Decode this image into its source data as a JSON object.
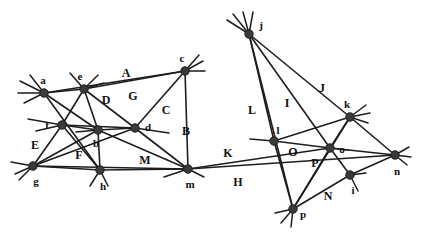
{
  "figure": {
    "width": 421,
    "height": 236,
    "background_color": "#ffffff",
    "stroke_color": "#1d1d1d",
    "vertex_color": "#3a3a3a"
  },
  "chart_data": {
    "type": "diagram",
    "xlabel": "",
    "ylabel": "",
    "xlim": [
      0,
      421
    ],
    "ylim": [
      0,
      236
    ],
    "grid": false,
    "legend": "none",
    "points": [
      {
        "id": "a",
        "label": "a",
        "x": 44,
        "y": 93,
        "label_x": 43,
        "label_y": 80
      },
      {
        "id": "e",
        "label": "e",
        "x": 84,
        "y": 89,
        "label_x": 80,
        "label_y": 76
      },
      {
        "id": "c",
        "label": "c",
        "x": 185,
        "y": 71,
        "label_x": 182,
        "label_y": 58
      },
      {
        "id": "f",
        "label": "f",
        "x": 62,
        "y": 125,
        "label_x": 47,
        "label_y": 125
      },
      {
        "id": "b",
        "label": "b",
        "x": 98,
        "y": 130,
        "label_x": 96,
        "label_y": 143
      },
      {
        "id": "d",
        "label": "d",
        "x": 135,
        "y": 128,
        "label_x": 148,
        "label_y": 127
      },
      {
        "id": "g",
        "label": "g",
        "x": 33,
        "y": 166,
        "label_x": 36,
        "label_y": 181
      },
      {
        "id": "h",
        "label": "h",
        "x": 100,
        "y": 170,
        "label_x": 103,
        "label_y": 186
      },
      {
        "id": "m",
        "label": "m",
        "x": 188,
        "y": 169,
        "label_x": 190,
        "label_y": 184
      },
      {
        "id": "j",
        "label": "j",
        "x": 249,
        "y": 34,
        "label_x": 261,
        "label_y": 25
      },
      {
        "id": "k",
        "label": "k",
        "x": 350,
        "y": 117,
        "label_x": 347,
        "label_y": 104
      },
      {
        "id": "l",
        "label": "l",
        "x": 274,
        "y": 141,
        "label_x": 278,
        "label_y": 130
      },
      {
        "id": "o",
        "label": "o",
        "x": 330,
        "y": 148,
        "label_x": 342,
        "label_y": 149
      },
      {
        "id": "n",
        "label": "n",
        "x": 395,
        "y": 155,
        "label_x": 397,
        "label_y": 171
      },
      {
        "id": "i",
        "label": "i",
        "x": 350,
        "y": 175,
        "label_x": 353,
        "label_y": 190
      },
      {
        "id": "p",
        "label": "p",
        "x": 293,
        "y": 209,
        "label_x": 303,
        "label_y": 214
      }
    ],
    "line_labels": [
      {
        "id": "A",
        "label": "A",
        "x": 126,
        "y": 73
      },
      {
        "id": "B",
        "label": "B",
        "x": 186,
        "y": 131
      },
      {
        "id": "C",
        "label": "C",
        "x": 166,
        "y": 110
      },
      {
        "id": "D",
        "label": "D",
        "x": 106,
        "y": 100
      },
      {
        "id": "E",
        "label": "E",
        "x": 35,
        "y": 145
      },
      {
        "id": "F",
        "label": "F",
        "x": 79,
        "y": 155
      },
      {
        "id": "G",
        "label": "G",
        "x": 133,
        "y": 96
      },
      {
        "id": "H",
        "label": "H",
        "x": 238,
        "y": 182
      },
      {
        "id": "I",
        "label": "I",
        "x": 287,
        "y": 103
      },
      {
        "id": "J",
        "label": "J",
        "x": 322,
        "y": 88
      },
      {
        "id": "K",
        "label": "K",
        "x": 228,
        "y": 153
      },
      {
        "id": "L",
        "label": "L",
        "x": 252,
        "y": 110
      },
      {
        "id": "M",
        "label": "M",
        "x": 145,
        "y": 160
      },
      {
        "id": "N",
        "label": "N",
        "x": 328,
        "y": 196
      },
      {
        "id": "O",
        "label": "O",
        "x": 293,
        "y": 152
      },
      {
        "id": "P",
        "label": "P",
        "x": 315,
        "y": 163
      }
    ],
    "edges": [
      {
        "from": "a",
        "to": "e"
      },
      {
        "from": "e",
        "to": "c"
      },
      {
        "from": "a",
        "to": "c"
      },
      {
        "from": "a",
        "to": "b"
      },
      {
        "from": "a",
        "to": "h"
      },
      {
        "from": "e",
        "to": "f"
      },
      {
        "from": "e",
        "to": "b"
      },
      {
        "from": "e",
        "to": "d"
      },
      {
        "from": "f",
        "to": "b"
      },
      {
        "from": "f",
        "to": "d"
      },
      {
        "from": "f",
        "to": "g"
      },
      {
        "from": "f",
        "to": "h"
      },
      {
        "from": "b",
        "to": "d"
      },
      {
        "from": "b",
        "to": "g"
      },
      {
        "from": "b",
        "to": "h"
      },
      {
        "from": "b",
        "to": "m"
      },
      {
        "from": "d",
        "to": "c"
      },
      {
        "from": "d",
        "to": "g"
      },
      {
        "from": "d",
        "to": "m"
      },
      {
        "from": "c",
        "to": "m"
      },
      {
        "from": "g",
        "to": "h"
      },
      {
        "from": "h",
        "to": "m"
      },
      {
        "from": "g",
        "to": "m"
      },
      {
        "from": "m",
        "to": "o"
      },
      {
        "from": "m",
        "to": "n"
      },
      {
        "from": "j",
        "to": "l"
      },
      {
        "from": "j",
        "to": "p"
      },
      {
        "from": "j",
        "to": "k"
      },
      {
        "from": "j",
        "to": "o"
      },
      {
        "from": "l",
        "to": "o"
      },
      {
        "from": "l",
        "to": "k"
      },
      {
        "from": "l",
        "to": "p"
      },
      {
        "from": "k",
        "to": "o"
      },
      {
        "from": "k",
        "to": "n"
      },
      {
        "from": "k",
        "to": "p"
      },
      {
        "from": "o",
        "to": "n"
      },
      {
        "from": "o",
        "to": "i"
      },
      {
        "from": "o",
        "to": "p"
      },
      {
        "from": "i",
        "to": "n"
      },
      {
        "from": "i",
        "to": "p"
      }
    ],
    "stubs": [
      {
        "at": "a",
        "dx": -24,
        "dy": -12
      },
      {
        "at": "a",
        "dx": -26,
        "dy": 0
      },
      {
        "at": "a",
        "dx": -20,
        "dy": 10
      },
      {
        "at": "a",
        "dx": -14,
        "dy": -18
      },
      {
        "at": "e",
        "dx": -14,
        "dy": -16
      },
      {
        "at": "e",
        "dx": 14,
        "dy": -14
      },
      {
        "at": "e",
        "dx": 20,
        "dy": -6
      },
      {
        "at": "c",
        "dx": 18,
        "dy": -10
      },
      {
        "at": "c",
        "dx": 20,
        "dy": 0
      },
      {
        "at": "c",
        "dx": 14,
        "dy": -16
      },
      {
        "at": "f",
        "dx": -34,
        "dy": -6
      },
      {
        "at": "f",
        "dx": -26,
        "dy": 6
      },
      {
        "at": "g",
        "dx": -22,
        "dy": -4
      },
      {
        "at": "g",
        "dx": -14,
        "dy": 14
      },
      {
        "at": "g",
        "dx": -18,
        "dy": 8
      },
      {
        "at": "h",
        "dx": -10,
        "dy": 16
      },
      {
        "at": "h",
        "dx": 8,
        "dy": 16
      },
      {
        "at": "d",
        "dx": 34,
        "dy": 5
      },
      {
        "at": "b",
        "dx": -22,
        "dy": 2
      },
      {
        "at": "m",
        "dx": -24,
        "dy": 8
      },
      {
        "at": "m",
        "dx": 16,
        "dy": 8
      },
      {
        "at": "j",
        "dx": -22,
        "dy": -14
      },
      {
        "at": "j",
        "dx": -16,
        "dy": -20
      },
      {
        "at": "j",
        "dx": -6,
        "dy": -22
      },
      {
        "at": "j",
        "dx": 4,
        "dy": -22
      },
      {
        "at": "k",
        "dx": 16,
        "dy": -12
      },
      {
        "at": "k",
        "dx": 20,
        "dy": -4
      },
      {
        "at": "k",
        "dx": 18,
        "dy": 6
      },
      {
        "at": "l",
        "dx": -24,
        "dy": -2
      },
      {
        "at": "o",
        "dx": 18,
        "dy": 2
      },
      {
        "at": "n",
        "dx": 14,
        "dy": -8
      },
      {
        "at": "n",
        "dx": 16,
        "dy": 2
      },
      {
        "at": "n",
        "dx": 12,
        "dy": 10
      },
      {
        "at": "i",
        "dx": 16,
        "dy": -2
      },
      {
        "at": "i",
        "dx": 8,
        "dy": 16
      },
      {
        "at": "p",
        "dx": -18,
        "dy": 4
      },
      {
        "at": "p",
        "dx": -12,
        "dy": 14
      },
      {
        "at": "p",
        "dx": -2,
        "dy": 18
      }
    ]
  }
}
